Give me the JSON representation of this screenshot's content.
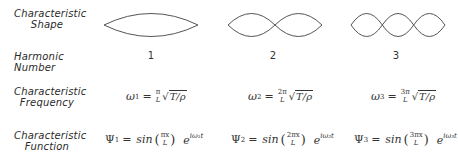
{
  "row_labels": {
    "shape": [
      "Characteristic",
      "Shape"
    ],
    "harmonic": "Harmonic Number",
    "frequency": [
      "Characteristic",
      "Frequency"
    ],
    "function": [
      "Characteristic",
      "Function"
    ]
  },
  "harmonics": [
    {
      "number": "1",
      "shape": "one-loop standing wave",
      "freq": {
        "omega": "ω",
        "sub": "1",
        "eq": "=",
        "num": "π",
        "den": "L",
        "root": "T/ρ"
      },
      "func": {
        "psi": "Ψ",
        "sub": "1",
        "eq": "=",
        "sin": "sin",
        "num": "πx",
        "den": "L",
        "e": "e",
        "exp": "iω₁t"
      }
    },
    {
      "number": "2",
      "shape": "two-loop standing wave",
      "freq": {
        "omega": "ω",
        "sub": "2",
        "eq": "=",
        "num": "2π",
        "den": "L",
        "root": "T/ρ"
      },
      "func": {
        "psi": "Ψ",
        "sub": "2",
        "eq": "=",
        "sin": "sin",
        "num": "2πx",
        "den": "L",
        "e": "e",
        "exp": "iω₂t"
      }
    },
    {
      "number": "3",
      "shape": "three-loop standing wave",
      "freq": {
        "omega": "ω",
        "sub": "3",
        "eq": "=",
        "num": "3π",
        "den": "L",
        "root": "T/ρ"
      },
      "func": {
        "psi": "Ψ",
        "sub": "3",
        "eq": "=",
        "sin": "sin",
        "num": "3πx",
        "den": "L",
        "e": "e",
        "exp": "iω₃t"
      }
    }
  ],
  "colors": {
    "stroke": "#555555",
    "text": "#333333"
  }
}
